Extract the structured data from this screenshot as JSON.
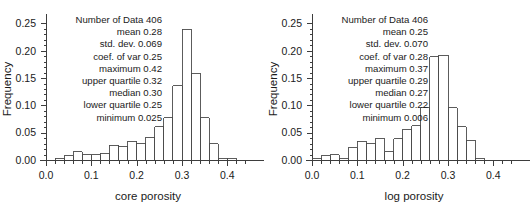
{
  "figure": {
    "background_color": "#ffffff",
    "axis_color": "#3d3d3d",
    "bar_edge_color": "#4a4a4a"
  },
  "chart_data": [
    {
      "type": "bar",
      "name": "core-porosity-histogram",
      "title": "",
      "xlabel": "core porosity",
      "ylabel": "Frequency",
      "xlim": [
        0.0,
        0.45
      ],
      "ylim": [
        0.0,
        0.26
      ],
      "grid": false,
      "legend": "none",
      "bin_width": 0.02,
      "xticks": [
        "0.0",
        "0.1",
        "0.2",
        "0.3",
        "0.4"
      ],
      "xtick_values": [
        0.0,
        0.1,
        0.2,
        0.3,
        0.4
      ],
      "yticks": [
        "0.00",
        "0.05",
        "0.10",
        "0.15",
        "0.20",
        "0.25"
      ],
      "ytick_values": [
        0.0,
        0.05,
        0.1,
        0.15,
        0.2,
        0.25
      ],
      "bin_starts": [
        0.02,
        0.04,
        0.06,
        0.08,
        0.1,
        0.12,
        0.14,
        0.16,
        0.18,
        0.2,
        0.22,
        0.24,
        0.26,
        0.28,
        0.3,
        0.32,
        0.34,
        0.36,
        0.38,
        0.4
      ],
      "values": [
        0.003,
        0.008,
        0.015,
        0.01,
        0.01,
        0.012,
        0.027,
        0.025,
        0.034,
        0.031,
        0.042,
        0.061,
        0.077,
        0.136,
        0.239,
        0.159,
        0.077,
        0.03,
        0.002,
        0.003
      ],
      "stats": {
        "number_of_data_label": "Number of Data",
        "number_of_data": "406",
        "mean_label": "mean",
        "mean": "0.28",
        "std_dev_label": "std. dev.",
        "std_dev": "0.069",
        "coef_var_label": "coef. of var",
        "coef_var": "0.25",
        "maximum_label": "maximum",
        "maximum": "0.42",
        "upper_quartile_label": "upper quartile",
        "upper_quartile": "0.32",
        "median_label": "median",
        "median": "0.30",
        "lower_quartile_label": "lower quartile",
        "lower_quartile": "0.25",
        "minimum_label": "minimum",
        "minimum": "0.025"
      },
      "stat_lines": [
        "Number of Data  406",
        "mean 0.28",
        "std. dev. 0.069",
        "coef. of var 0.25",
        "maximum 0.42",
        "upper quartile 0.32",
        "median 0.30",
        "lower quartile 0.25",
        "minimum 0.025"
      ]
    },
    {
      "type": "bar",
      "name": "log-porosity-histogram",
      "title": "",
      "xlabel": "log porosity",
      "ylabel": "Frequency",
      "xlim": [
        0.0,
        0.45
      ],
      "ylim": [
        0.0,
        0.26
      ],
      "grid": false,
      "legend": "none",
      "bin_width": 0.02,
      "xticks": [
        "0.0",
        "0.1",
        "0.2",
        "0.3",
        "0.4"
      ],
      "xtick_values": [
        0.0,
        0.1,
        0.2,
        0.3,
        0.4
      ],
      "yticks": [
        "0.00",
        "0.05",
        "0.10",
        "0.15",
        "0.20",
        "0.25"
      ],
      "ytick_values": [
        0.0,
        0.05,
        0.1,
        0.15,
        0.2,
        0.25
      ],
      "bin_starts": [
        0.0,
        0.02,
        0.04,
        0.06,
        0.08,
        0.1,
        0.12,
        0.14,
        0.16,
        0.18,
        0.2,
        0.22,
        0.24,
        0.26,
        0.28,
        0.3,
        0.32,
        0.34,
        0.36
      ],
      "values": [
        0.003,
        0.008,
        0.01,
        0.003,
        0.022,
        0.034,
        0.031,
        0.039,
        0.015,
        0.039,
        0.056,
        0.063,
        0.096,
        0.189,
        0.192,
        0.096,
        0.061,
        0.036,
        0.003
      ],
      "stats": {
        "number_of_data_label": "Number of Data",
        "number_of_data": "406",
        "mean_label": "mean",
        "mean": "0.25",
        "std_dev_label": "std. dev.",
        "std_dev": "0.070",
        "coef_var_label": "coef. of var",
        "coef_var": "0.28",
        "maximum_label": "maximum",
        "maximum": "0.37",
        "upper_quartile_label": "upper quartile",
        "upper_quartile": "0.29",
        "median_label": "median",
        "median": "0.27",
        "lower_quartile_label": "lower quartile",
        "lower_quartile": "0.22",
        "minimum_label": "minimum",
        "minimum": "0.006"
      },
      "stat_lines": [
        "Number of Data  406",
        "mean 0.25",
        "std. dev. 0.070",
        "coef. of var 0.28",
        "maximum 0.37",
        "upper quartile 0.29",
        "median 0.27",
        "lower quartile 0.22",
        "minimum 0.006"
      ]
    }
  ]
}
